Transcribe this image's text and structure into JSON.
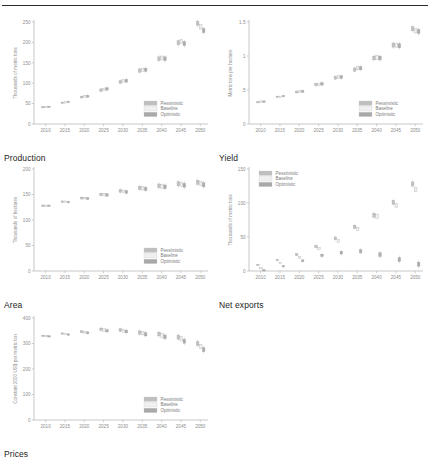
{
  "figure": {
    "top_rule": true,
    "panel_order": [
      "production",
      "yield",
      "area",
      "net_exports",
      "prices"
    ]
  },
  "legend": {
    "items": [
      {
        "label": "Pessimistic",
        "color": "#bfbfbf"
      },
      {
        "label": "Baseline",
        "color": "#f0f0f0"
      },
      {
        "label": "Optimistic",
        "color": "#a8a8a8"
      }
    ]
  },
  "chart_data": [
    {
      "type": "scatter",
      "key": "production",
      "title": "Production",
      "xlabel": "",
      "ylabel": "Thousands of metric tons",
      "xlim": [
        2007,
        2052
      ],
      "ylim": [
        0,
        250
      ],
      "yticks": [
        0,
        50,
        100,
        150,
        200,
        250
      ],
      "xticks": [
        2010,
        2015,
        2020,
        2025,
        2030,
        2035,
        2040,
        2045,
        2050
      ],
      "grid": false,
      "legend_position": "bottom-right",
      "x": [
        2010,
        2015,
        2020,
        2025,
        2030,
        2035,
        2040,
        2045,
        2050
      ],
      "series": [
        {
          "name": "Pessimistic",
          "values": [
            41,
            52,
            66,
            83,
            103,
            131,
            160,
            199,
            247
          ]
        },
        {
          "name": "Baseline",
          "values": [
            42,
            53,
            67,
            85,
            105,
            133,
            162,
            202,
            238
          ]
        },
        {
          "name": "Optimistic",
          "values": [
            42,
            54,
            68,
            86,
            106,
            133,
            160,
            197,
            229
          ]
        }
      ]
    },
    {
      "type": "scatter",
      "key": "yield",
      "title": "Yield",
      "xlabel": "",
      "ylabel": "Metric tons per hectare",
      "xlim": [
        2007,
        2052
      ],
      "ylim": [
        0,
        1.5
      ],
      "yticks": [
        0,
        0.5,
        1,
        1.5
      ],
      "ytick_labels": [
        "0",
        ".5",
        "1",
        "1.5"
      ],
      "xticks": [
        2010,
        2015,
        2020,
        2025,
        2030,
        2035,
        2040,
        2045,
        2050
      ],
      "grid": false,
      "legend_position": "bottom-right",
      "x": [
        2010,
        2015,
        2020,
        2025,
        2030,
        2035,
        2040,
        2045,
        2050
      ],
      "series": [
        {
          "name": "Pessimistic",
          "values": [
            0.32,
            0.4,
            0.47,
            0.58,
            0.68,
            0.8,
            0.97,
            1.16,
            1.4
          ]
        },
        {
          "name": "Baseline",
          "values": [
            0.33,
            0.4,
            0.48,
            0.58,
            0.69,
            0.82,
            0.98,
            1.16,
            1.37
          ]
        },
        {
          "name": "Optimistic",
          "values": [
            0.33,
            0.41,
            0.48,
            0.59,
            0.69,
            0.82,
            0.97,
            1.15,
            1.36
          ]
        }
      ]
    },
    {
      "type": "scatter",
      "key": "area",
      "title": "Area",
      "xlabel": "",
      "ylabel": "Thousands of hectares",
      "xlim": [
        2007,
        2052
      ],
      "ylim": [
        0,
        200
      ],
      "yticks": [
        0,
        50,
        100,
        150,
        200
      ],
      "xticks": [
        2010,
        2015,
        2020,
        2025,
        2030,
        2035,
        2040,
        2045,
        2050
      ],
      "grid": false,
      "legend_position": "bottom-right",
      "x": [
        2010,
        2015,
        2020,
        2025,
        2030,
        2035,
        2040,
        2045,
        2050
      ],
      "series": [
        {
          "name": "Pessimistic",
          "values": [
            128,
            136,
            143,
            150,
            157,
            163,
            167,
            171,
            174
          ]
        },
        {
          "name": "Baseline",
          "values": [
            128,
            136,
            143,
            150,
            156,
            162,
            166,
            170,
            172
          ]
        },
        {
          "name": "Optimistic",
          "values": [
            128,
            135,
            142,
            149,
            155,
            161,
            165,
            168,
            169
          ]
        }
      ]
    },
    {
      "type": "scatter",
      "key": "net_exports",
      "title": "Net exports",
      "xlabel": "",
      "ylabel": "Thousands of metric tons",
      "xlim": [
        2007,
        2052
      ],
      "ylim": [
        0,
        150
      ],
      "yticks": [
        0,
        50,
        100,
        150
      ],
      "xticks": [
        2010,
        2015,
        2020,
        2025,
        2030,
        2035,
        2040,
        2045,
        2050
      ],
      "grid": false,
      "legend_position": "top-left",
      "x": [
        2010,
        2015,
        2020,
        2025,
        2030,
        2035,
        2040,
        2045,
        2050
      ],
      "series": [
        {
          "name": "Pessimistic",
          "values": [
            9,
            16,
            24,
            36,
            48,
            65,
            82,
            101,
            128
          ]
        },
        {
          "name": "Baseline",
          "values": [
            4,
            12,
            20,
            33,
            44,
            62,
            80,
            96,
            120
          ]
        },
        {
          "name": "Optimistic",
          "values": [
            1,
            7,
            15,
            23,
            27,
            29,
            24,
            17,
            10
          ]
        }
      ]
    },
    {
      "type": "scatter",
      "key": "prices",
      "title": "Prices",
      "xlabel": "",
      "ylabel": "Constant 2000 US$ per metric ton",
      "xlim": [
        2007,
        2052
      ],
      "ylim": [
        0,
        400
      ],
      "yticks": [
        0,
        100,
        200,
        300,
        400
      ],
      "xticks": [
        2010,
        2015,
        2020,
        2025,
        2030,
        2035,
        2040,
        2045,
        2050
      ],
      "grid": false,
      "legend_position": "bottom-right",
      "x": [
        2010,
        2015,
        2020,
        2025,
        2030,
        2035,
        2040,
        2045,
        2050
      ],
      "series": [
        {
          "name": "Pessimistic",
          "values": [
            330,
            339,
            346,
            356,
            353,
            343,
            337,
            325,
            300
          ]
        },
        {
          "name": "Baseline",
          "values": [
            329,
            337,
            344,
            353,
            350,
            340,
            332,
            318,
            288
          ]
        },
        {
          "name": "Optimistic",
          "values": [
            328,
            335,
            342,
            350,
            347,
            336,
            326,
            309,
            276
          ]
        }
      ]
    }
  ]
}
